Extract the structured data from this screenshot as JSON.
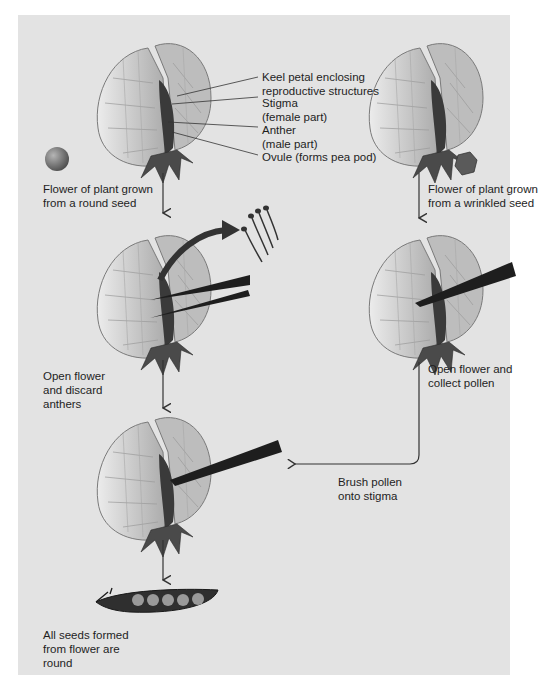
{
  "colors": {
    "panel_bg": "#e3e3e3",
    "page_bg": "#ffffff",
    "text": "#1e1e1e",
    "arrow": "#333333",
    "petal_fill": "#d0d0d0",
    "petal_stroke": "#7a7a7a",
    "keel": "#3a3a3a",
    "sepal": "#4a4a4a"
  },
  "anatomy_labels": {
    "keel": "Keel petal enclosing\nreproductive structures",
    "stigma": "Stigma\n(female part)",
    "anther": "Anther\n(male part)",
    "ovule": "Ovule (forms pea pod)"
  },
  "left_column": {
    "step1": "Flower of plant grown\nfrom a round seed",
    "step2": "Open flower\nand discard\nanthers",
    "result": "All seeds formed\nfrom flower are\nround"
  },
  "right_column": {
    "step1": "Flower of plant grown\nfrom a wrinkled seed",
    "step2": "Open flower and\ncollect pollen"
  },
  "transfer": {
    "label": "Brush pollen\nonto stigma"
  },
  "seeds": {
    "left": "round-seed",
    "right": "wrinkled-seed"
  },
  "pod": {
    "pea_count": 5
  }
}
